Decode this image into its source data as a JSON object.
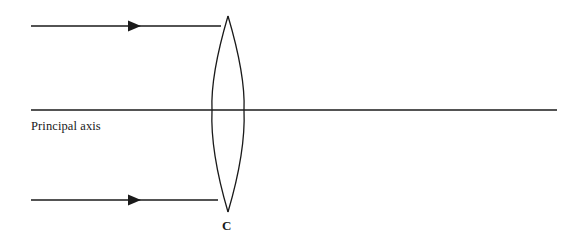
{
  "diagram": {
    "background_color": "#ffffff",
    "stroke_color": "#1a1a1a",
    "text_color": "#1a1a1a",
    "width": 572,
    "height": 244,
    "labels": {
      "principal_axis": "Principal axis",
      "center": "C"
    },
    "elements": {
      "lens": {
        "name": "convex-lens",
        "shape": "biconvex",
        "center_x": 228,
        "top_vertex_y": 16,
        "bottom_vertex_y": 212,
        "max_half_width": 17,
        "left_edge_x": 212,
        "right_edge_x": 245,
        "stroke_width": 1.3
      },
      "principal_axis": {
        "name": "principal-axis-line",
        "x_start": 31,
        "x_end": 557,
        "y": 110,
        "stroke_width": 1.4
      },
      "upper_ray": {
        "name": "upper-incident-ray",
        "x_start": 31,
        "x_end": 221,
        "y": 26,
        "arrow_x": 138,
        "stroke_width": 1.6,
        "direction": "right"
      },
      "lower_ray": {
        "name": "lower-incident-ray",
        "x_start": 31,
        "x_end": 218,
        "y": 200,
        "arrow_x": 138,
        "stroke_width": 1.6,
        "direction": "right"
      }
    }
  }
}
